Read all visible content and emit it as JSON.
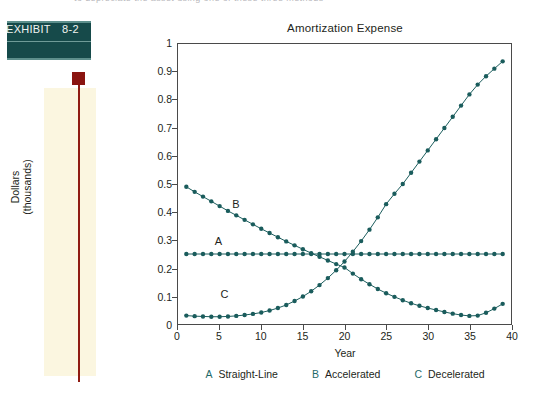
{
  "page": {
    "top_cutoff_text": "to depreciate the asset using one of these three methods"
  },
  "exhibit": {
    "label": "EXHIBIT",
    "number": "8-2"
  },
  "chart_data": {
    "type": "line",
    "title": "Amortization Expense",
    "xlabel": "Year",
    "ylabel": "Dollars (thousands)",
    "ylabel_line1": "Dollars",
    "ylabel_line2": "(thousands)",
    "xlim": [
      0,
      40
    ],
    "ylim": [
      0,
      1
    ],
    "grid": false,
    "legend_position": "bottom",
    "xticks": [
      "0",
      "5",
      "10",
      "15",
      "20",
      "25",
      "30",
      "35",
      "40"
    ],
    "xtick_values": [
      0,
      5,
      10,
      15,
      20,
      25,
      30,
      35,
      40
    ],
    "yticks": [
      "0",
      "0.1",
      "0.2",
      "0.3",
      "0.4",
      "0.5",
      "0.6",
      "0.7",
      "0.8",
      "0.9",
      "1"
    ],
    "ytick_values": [
      0,
      0.1,
      0.2,
      0.3,
      0.4,
      0.5,
      0.6,
      0.7,
      0.8,
      0.9,
      1
    ],
    "series_color": "#1a5c5c",
    "x": [
      1,
      2,
      3,
      4,
      5,
      6,
      7,
      8,
      9,
      10,
      11,
      12,
      13,
      14,
      15,
      16,
      17,
      18,
      19,
      20,
      21,
      22,
      23,
      24,
      25,
      26,
      27,
      28,
      29,
      30,
      31,
      32,
      33,
      34,
      35,
      36,
      37,
      38,
      39
    ],
    "series": [
      {
        "name": "Straight-Line",
        "key": "A",
        "label_x": 4.5,
        "label_y": 0.295,
        "values": [
          0.25,
          0.25,
          0.25,
          0.25,
          0.25,
          0.25,
          0.25,
          0.25,
          0.25,
          0.25,
          0.25,
          0.25,
          0.25,
          0.25,
          0.25,
          0.25,
          0.25,
          0.25,
          0.25,
          0.25,
          0.25,
          0.25,
          0.25,
          0.25,
          0.25,
          0.25,
          0.25,
          0.25,
          0.25,
          0.25,
          0.25,
          0.25,
          0.25,
          0.25,
          0.25,
          0.25,
          0.25,
          0.25,
          0.25
        ]
      },
      {
        "name": "Accelerated",
        "key": "B",
        "label_x": 6.6,
        "label_y": 0.425,
        "values": [
          0.49,
          0.472,
          0.455,
          0.438,
          0.421,
          0.404,
          0.388,
          0.372,
          0.356,
          0.34,
          0.325,
          0.31,
          0.295,
          0.281,
          0.267,
          0.253,
          0.24,
          0.227,
          0.214,
          0.202,
          0.18,
          0.16,
          0.142,
          0.125,
          0.11,
          0.097,
          0.085,
          0.074,
          0.065,
          0.057,
          0.05,
          0.043,
          0.037,
          0.032,
          0.029,
          0.03,
          0.04,
          0.055,
          0.072
        ]
      },
      {
        "name": "Decelerated",
        "key": "C",
        "label_x": 5.2,
        "label_y": 0.105,
        "values": [
          0.03,
          0.028,
          0.027,
          0.026,
          0.026,
          0.027,
          0.029,
          0.032,
          0.036,
          0.041,
          0.048,
          0.057,
          0.068,
          0.082,
          0.098,
          0.117,
          0.139,
          0.164,
          0.192,
          0.223,
          0.258,
          0.296,
          0.337,
          0.381,
          0.428,
          0.465,
          0.5,
          0.54,
          0.58,
          0.62,
          0.66,
          0.7,
          0.74,
          0.78,
          0.82,
          0.855,
          0.885,
          0.912,
          0.938
        ]
      }
    ],
    "legend": [
      {
        "key": "A",
        "label": "Straight-Line"
      },
      {
        "key": "B",
        "label": "Accelerated"
      },
      {
        "key": "C",
        "label": "Decelerated"
      }
    ]
  }
}
